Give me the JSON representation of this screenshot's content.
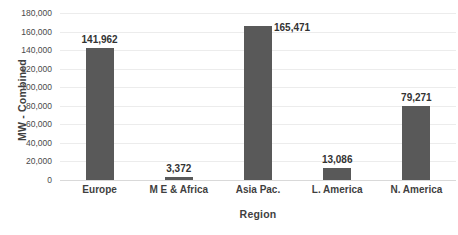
{
  "chart_data": {
    "type": "bar",
    "title": "",
    "xlabel": "Region",
    "ylabel": "MW - Combined",
    "categories": [
      "Europe",
      "M E & Africa",
      "Asia Pac.",
      "L. America",
      "N. America"
    ],
    "values": [
      141962,
      3372,
      165471,
      13086,
      79271
    ],
    "value_labels": [
      "141,962",
      "3,372",
      "165,471",
      "13,086",
      "79,271"
    ],
    "ylim": [
      0,
      180000
    ],
    "ytick_step": 20000,
    "ytick_labels": [
      "180,000",
      "160,000",
      "140,000",
      "120,000",
      "100,000",
      "80,000",
      "60,000",
      "40,000",
      "20,000",
      "0"
    ],
    "ytick_values": [
      180000,
      160000,
      140000,
      120000,
      100000,
      80000,
      60000,
      40000,
      20000,
      0
    ],
    "grid": true,
    "legend": false,
    "legend_position": "none",
    "bar_color": "#595959",
    "gridline_color": "#ececec",
    "text_color": "#3f3f3f",
    "background_color": "#ffffff",
    "label_placement": [
      "above",
      "above",
      "above-right",
      "above",
      "above"
    ]
  }
}
